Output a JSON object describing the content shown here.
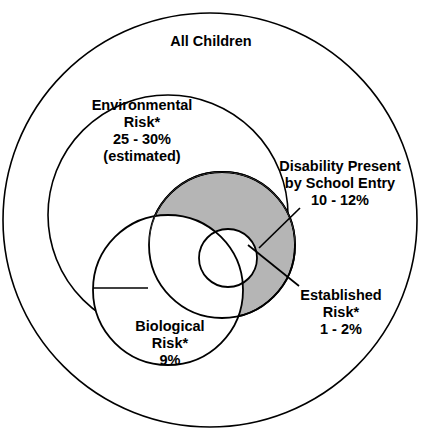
{
  "diagram": {
    "title": "All Children",
    "type": "venn",
    "background_color": "#ffffff",
    "stroke_color": "#000000",
    "shaded_fill_color": "#b5b5b5",
    "white_fill_color": "#ffffff",
    "footnote_marker": "*",
    "sets": [
      {
        "id": "all-children",
        "name": "All Children",
        "lines": [
          "All Children"
        ],
        "fill": "#ffffff",
        "percent_text": "",
        "shaded": false
      },
      {
        "id": "environmental-risk",
        "name": "Environmental Risk",
        "lines": [
          "Environmental",
          "Risk*",
          "25 - 30%",
          "(estimated)"
        ],
        "fill": "#ffffff",
        "percent_text": "25 - 30%",
        "qualifier": "(estimated)",
        "shaded": false
      },
      {
        "id": "disability-present",
        "name": "Disability Present by School Entry",
        "lines": [
          "Disability Present",
          "by School Entry",
          "10 - 12%"
        ],
        "fill": "#b5b5b5",
        "percent_text": "10 - 12%",
        "shaded": true
      },
      {
        "id": "established-risk",
        "name": "Established Risk",
        "lines": [
          "Established",
          "Risk*",
          "1 - 2%"
        ],
        "fill": "#ffffff",
        "percent_text": "1 - 2%",
        "shaded": false
      },
      {
        "id": "biological-risk",
        "name": "Biological Risk",
        "lines": [
          "Biological",
          "Risk*",
          "9%"
        ],
        "fill": "#ffffff",
        "percent_text": "9%",
        "shaded": false
      }
    ],
    "labels": {
      "all_children": {
        "line1": "All Children"
      },
      "environmental": {
        "line1": "Environmental",
        "line2": "Risk*",
        "line3": "25 - 30%",
        "line4": "(estimated)"
      },
      "disability": {
        "line1": "Disability Present",
        "line2": "by School Entry",
        "line3": "10 - 12%"
      },
      "established": {
        "line1": "Established",
        "line2": "Risk*",
        "line3": "1 - 2%"
      },
      "biological": {
        "line1": "Biological",
        "line2": "Risk*",
        "line3": "9%"
      }
    }
  }
}
